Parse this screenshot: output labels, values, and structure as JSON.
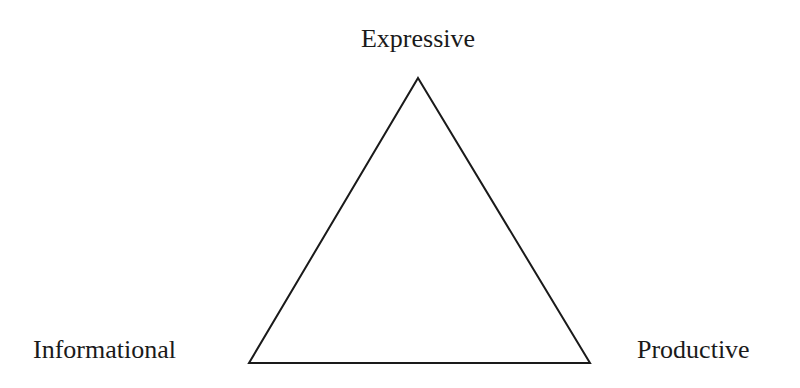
{
  "diagram": {
    "type": "triangle-model",
    "background_color": "#ffffff",
    "stroke_color": "#1a1a1a",
    "stroke_width": 2,
    "fill": "none",
    "vertices": [
      {
        "id": "apex",
        "label": "Expressive",
        "x": 418,
        "y": 78,
        "label_position": "above"
      },
      {
        "id": "bottom-left",
        "label": "Informational",
        "x": 249,
        "y": 363,
        "label_position": "left"
      },
      {
        "id": "bottom-right",
        "label": "Productive",
        "x": 590,
        "y": 363,
        "label_position": "right"
      }
    ],
    "edges": [
      {
        "from": "apex",
        "to": "bottom-right"
      },
      {
        "from": "bottom-right",
        "to": "bottom-left"
      },
      {
        "from": "bottom-left",
        "to": "apex"
      }
    ],
    "labels": {
      "top": "Expressive",
      "bottom_left": "Informational",
      "bottom_right": "Productive"
    }
  }
}
